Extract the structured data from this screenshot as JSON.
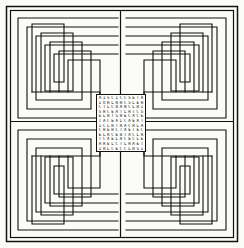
{
  "figure": {
    "background_color": "#fbfbf8",
    "ink_color": "#111111",
    "frame": {
      "outer_inset": 6,
      "inner_inset": 10,
      "stroke_width": 1.4
    },
    "maze": {
      "type": "rectilinear-spiral-quadrants",
      "quadrant_count": 4,
      "rings_per_quadrant": 5,
      "ring_spacing": 9,
      "stroke_width": 1.1,
      "symmetry": "four-fold mirror",
      "center_divider": {
        "vertical": true,
        "horizontal": true,
        "x": 120,
        "y": 122
      }
    },
    "center_block": {
      "x": 96,
      "y": 94,
      "width": 50,
      "height": 58,
      "border_color": "#111111",
      "columns": 11,
      "rows": 12,
      "rows_text": [
        "AISCICCSETA",
        "IORLRRCSLER",
        "CTLCBANCLRI",
        "SRCEATLRTCS",
        "ELRTSRECACE",
        "TACEALCAEAT",
        "ICLRTRACRLA",
        "CRERCTAETEC",
        "ELRCEBTACLR",
        "TCAELRCECLE",
        "ARELCTLRAET",
        "IRLCECCLRSI"
      ]
    }
  }
}
